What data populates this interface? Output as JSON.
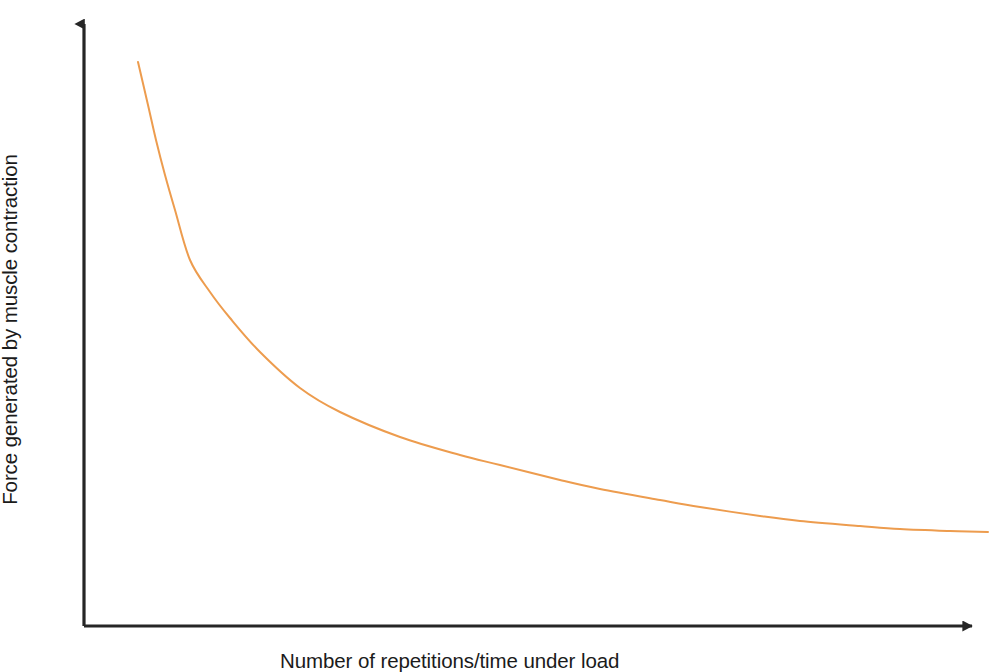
{
  "figure": {
    "name": "force-vs-repetitions-curve",
    "background_color": "#ffffff",
    "axis_color": "#262626",
    "curve_color": "#ED9C4E"
  },
  "axes": {
    "y_label": "Force generated by muscle contraction",
    "x_label": "Number of repetitions/time under load"
  },
  "chart_data": {
    "type": "line",
    "title": "",
    "subtitle": "",
    "xlabel": "Number of repetitions/time under load",
    "ylabel": "Force generated by muscle contraction",
    "grid": false,
    "legend": false,
    "legend_position": "none",
    "axis_style": "arrow-headed open axes, no tick marks, no tick labels",
    "xlim": [
      0,
      100
    ],
    "ylim": [
      0,
      100
    ],
    "x_tick_labels": [],
    "y_tick_labels": [],
    "annotations": [],
    "series": [
      {
        "name": "Force decay with repetitions",
        "color": "#ED9C4E",
        "line_width": 2,
        "description": "Monotonically decreasing hyperbolic decay curve: force falls steeply at low repetition counts then flattens to a low plateau at high repetition counts.",
        "x": [
          6,
          8,
          10,
          12,
          14,
          17,
          20,
          24,
          28,
          33,
          38,
          43,
          50,
          57,
          64,
          71,
          78,
          85,
          92,
          100
        ],
        "y": [
          93,
          84,
          75,
          67,
          60,
          52,
          45,
          39,
          34,
          29,
          25,
          22,
          19,
          16.5,
          14.5,
          13,
          12,
          11.2,
          10.6,
          10.2
        ]
      }
    ],
    "pixel_path": {
      "note": "curve trace in screenshot pixel coordinates",
      "points": [
        [
          138,
          62
        ],
        [
          148,
          105
        ],
        [
          156,
          140
        ],
        [
          165,
          175
        ],
        [
          175,
          210
        ],
        [
          190,
          260
        ],
        [
          210,
          292
        ],
        [
          230,
          318
        ],
        [
          260,
          352
        ],
        [
          300,
          388
        ],
        [
          340,
          412
        ],
        [
          400,
          437
        ],
        [
          460,
          455
        ],
        [
          500,
          465
        ],
        [
          560,
          480
        ],
        [
          600,
          489
        ],
        [
          660,
          500
        ],
        [
          700,
          507
        ],
        [
          760,
          516
        ],
        [
          800,
          521
        ],
        [
          860,
          526
        ],
        [
          900,
          529
        ],
        [
          950,
          531
        ],
        [
          988,
          532
        ]
      ]
    }
  }
}
